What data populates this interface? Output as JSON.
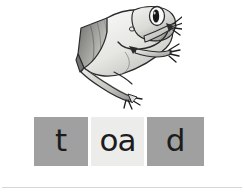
{
  "page": {
    "background_color": "#ffffff"
  },
  "illustration": {
    "name": "frog-illustration",
    "subject": "toad",
    "description": "grayscale cartoon toad leaping to the right",
    "style": "pencil-shaded line drawing",
    "colors": {
      "outline": "#2b2b2b",
      "body_light": "#f0f0ef",
      "body_mid": "#b9b9b6",
      "body_dark": "#7d7d7a",
      "shadow": "#58585a",
      "eye_pupil": "#161616"
    }
  },
  "phoneme_frame": {
    "name": "phoneme-frame",
    "word": "toad",
    "boxes": [
      {
        "id": "box-t",
        "grapheme": "t",
        "shade": "shaded",
        "color": "#a0a0a0"
      },
      {
        "id": "box-oa",
        "grapheme": "oa",
        "shade": "light",
        "color": "#ececeb"
      },
      {
        "id": "box-d",
        "grapheme": "d",
        "shade": "shaded",
        "color": "#a0a0a0"
      }
    ]
  },
  "footer": {
    "rule_color": "#d6d6d6"
  }
}
